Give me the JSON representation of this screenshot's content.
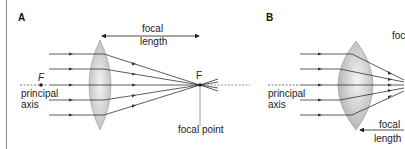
{
  "panels": [
    {
      "id": "A",
      "label": "A",
      "focal_length_label": [
        "focal",
        "length"
      ],
      "focus_label": "F",
      "focal_point_label": "focal point",
      "axis_label": [
        "principal",
        "axis"
      ],
      "lens_type": "thin convex lens"
    },
    {
      "id": "B",
      "label": "B",
      "focal_length_label_top": "foc",
      "focal_length_label": [
        "focal",
        "length"
      ],
      "axis_label": [
        "principal",
        "axis"
      ],
      "lens_type": "thick convex lens"
    }
  ],
  "colors": {
    "lens_fill": "#c8c8c8",
    "lens_highlight": "#f2f2f2",
    "ray": "#333333",
    "axis": "#555555"
  }
}
